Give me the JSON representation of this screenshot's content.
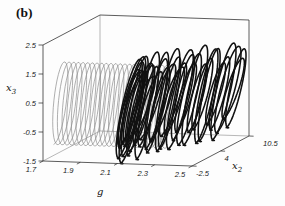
{
  "chart_data": {
    "type": "line3d",
    "title": "",
    "panel_label": "(b)",
    "background": "#fdfdfd",
    "box": true,
    "axes": {
      "g": {
        "label": {
          "base": "g",
          "sub": ""
        },
        "range": [
          1.7,
          2.5
        ],
        "ticks": [
          1.7,
          1.9,
          2.1,
          2.3,
          2.5
        ]
      },
      "x2": {
        "label": {
          "base": "x",
          "sub": "2"
        },
        "range": [
          -2.5,
          10.5
        ],
        "ticks": [
          -2.5,
          4,
          10.5
        ]
      },
      "x3": {
        "label": {
          "base": "x",
          "sub": "3"
        },
        "range": [
          -1.5,
          2.5
        ],
        "ticks": [
          2.5,
          1.5,
          0.5,
          -0.5,
          -1.5
        ]
      }
    },
    "frame": {
      "front_color": "#333333",
      "back_color": "#888888",
      "tick_color": "#222222"
    },
    "series": [
      {
        "name": "periodic-orbit-coil",
        "style": "uniform",
        "color": "#8c8c8c",
        "stroke_width": 0.7,
        "loops": 24,
        "g_start": 1.72,
        "g_end": 2.32,
        "x2_center": 0,
        "x2_radius": 2.0,
        "x3_center": 0.3,
        "x3_radius": 1.35,
        "phase": 0.45
      },
      {
        "name": "chaotic-attractor-coil",
        "style": "jitter",
        "color": "#111111",
        "stroke_width": 1.55,
        "loops": 38,
        "g_start": 2.095,
        "g_end": 2.5,
        "x2_start": 0,
        "x2_end": 8,
        "x2_radius": 2.8,
        "x2_radius_jitter": 0.8,
        "x3_center_start": 0.18,
        "x3_center_end": 0.32,
        "x3_center_jitter": 0.12,
        "x3_radius": 1.28,
        "x3_radius_wave": 0.34,
        "x3_radius_jitter": 0.22,
        "phase": 0.85,
        "bunching": 1.6,
        "loop_advance": 0.013,
        "seed": 7
      }
    ]
  }
}
